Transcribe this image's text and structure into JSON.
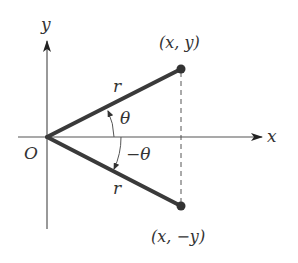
{
  "diagram": {
    "type": "coordinate-reflection",
    "axes": {
      "x_label": "x",
      "y_label": "y",
      "origin_label": "O"
    },
    "points": {
      "upper": {
        "label": "(x, y)"
      },
      "lower": {
        "label": "(x, −y)"
      }
    },
    "segments": {
      "upper_radius_label": "r",
      "lower_radius_label": "r"
    },
    "angles": {
      "upper": "θ",
      "lower": "−θ"
    },
    "colors": {
      "axis": "#444444",
      "segment": "#3a3a3a",
      "point": "#333333",
      "text": "#333333"
    }
  }
}
